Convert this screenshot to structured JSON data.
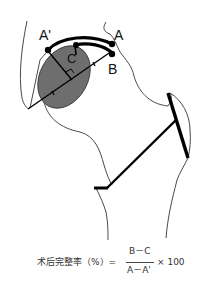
{
  "diagram": {
    "labels": {
      "a_prime": "A'",
      "a": "A",
      "b": "B",
      "c": "C"
    },
    "colors": {
      "outline": "#4a4a4a",
      "thick_line": "#000000",
      "shaded_region": "#6e6e6e",
      "background": "#ffffff"
    }
  },
  "formula": {
    "lhs": "术后完整率（%）=",
    "numerator": "B－C",
    "denominator": "A－A'",
    "multiplier": "× 100"
  }
}
